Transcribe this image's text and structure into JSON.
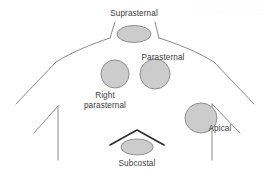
{
  "figure": {
    "background_color": "#ffffff",
    "outline_color": "#8a8a8a",
    "costal_margin_color": "#2e2e2e",
    "window_fill_color": "#cccccc",
    "window_stroke_color": "#8f8f8f",
    "label_color": "#3a3a3a"
  },
  "watermark": {
    "text": "RESOURCE"
  },
  "windows": [
    {
      "id": "suprasternal",
      "label": "Suprasternal",
      "shape": "ellipse",
      "cx": 134,
      "cy": 34,
      "rx": 17,
      "ry": 8.5,
      "label_x": 134,
      "label_y": 16,
      "label_anchor": "middle"
    },
    {
      "id": "parasternal",
      "label": "Parasternal",
      "shape": "circle",
      "cx": 155,
      "cy": 74,
      "rx": 15,
      "ry": 15,
      "label_x": 163,
      "label_y": 60,
      "label_anchor": "middle"
    },
    {
      "id": "right-parasternal",
      "label": "Right parasternal",
      "label_line_1": "Right",
      "label_line_2": "parasternal",
      "shape": "circle",
      "cx": 115,
      "cy": 74,
      "rx": 14,
      "ry": 14,
      "label_x": 105,
      "label_y": 98,
      "label_anchor": "middle"
    },
    {
      "id": "apical",
      "label": "Apical",
      "shape": "circle",
      "cx": 201,
      "cy": 118,
      "rx": 16,
      "ry": 15,
      "label_x": 220,
      "label_y": 131,
      "label_anchor": "middle"
    },
    {
      "id": "subcostal",
      "label": "Subcostal",
      "shape": "ellipse",
      "cx": 137,
      "cy": 147,
      "rx": 16,
      "ry": 8,
      "label_x": 137,
      "label_y": 166,
      "label_anchor": "middle"
    }
  ],
  "outline_paths": {
    "neck_left": "M 115 22 L 110 38",
    "neck_right": "M 155 22 L 159 38",
    "shoulder_left": "M 110 38 C 92 44, 72 52, 56 62",
    "shoulder_left_lower": "M 56 62 L 16 104",
    "shoulder_right": "M 159 38 C 178 44, 198 52, 214 62",
    "shoulder_right_lower": "M 214 62 L 254 104",
    "arm_left_diagonal": "M 34 133 L 58 106",
    "arm_left_vertical": "M 58 106 L 58 160",
    "arm_right_diagonal": "M 240 133 L 212 104",
    "arm_right_vertical": "M 212 104 L 212 160",
    "costal_margin": "M 110 145 L 137 130 L 164 145"
  },
  "icon_names": {
    "suprasternal": "suprasternal-window-icon",
    "parasternal": "parasternal-window-icon",
    "right_parasternal": "right-parasternal-window-icon",
    "apical": "apical-window-icon",
    "subcostal": "subcostal-window-icon"
  }
}
